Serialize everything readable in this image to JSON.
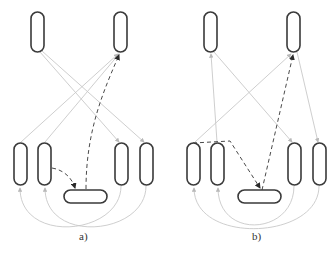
{
  "figure": {
    "panels": [
      {
        "id": "a",
        "caption": "a)",
        "nodes": {
          "top": [
            "top-left",
            "top-right"
          ],
          "bottom": [
            "bottom-1",
            "bottom-2",
            "bottom-3",
            "bottom-4"
          ],
          "center": "center-horizontal"
        },
        "edges_solid": [
          {
            "from": "bottom-1",
            "to": "top-right"
          },
          {
            "from": "bottom-2",
            "to": "top-right"
          },
          {
            "from": "top-left",
            "to": "bottom-3"
          },
          {
            "from": "top-left",
            "to": "bottom-4"
          },
          {
            "from": "bottom-3",
            "to": "bottom-1",
            "shape": "arc"
          },
          {
            "from": "bottom-4",
            "to": "bottom-2",
            "shape": "arc"
          }
        ],
        "edges_dashed": [
          {
            "from": "bottom-2",
            "to": "center-horizontal"
          },
          {
            "from": "center-horizontal",
            "to": "top-right"
          }
        ]
      },
      {
        "id": "b",
        "caption": "b)",
        "nodes": {
          "top": [
            "top-left",
            "top-right"
          ],
          "bottom": [
            "bottom-1",
            "bottom-2",
            "bottom-3",
            "bottom-4"
          ],
          "center": "center-horizontal"
        },
        "edges_solid": [
          {
            "from": "bottom-1",
            "to": "top-right"
          },
          {
            "from": "bottom-2",
            "to": "top-left"
          },
          {
            "from": "top-left",
            "to": "bottom-3"
          },
          {
            "from": "top-right",
            "to": "bottom-4"
          },
          {
            "from": "bottom-4",
            "to": "bottom-1",
            "shape": "arc"
          },
          {
            "from": "bottom-3",
            "to": "bottom-2",
            "shape": "arc"
          }
        ],
        "edges_dashed": [
          {
            "from": "bottom-1",
            "to": "center-horizontal",
            "via": "horizontal-then-diagonal"
          },
          {
            "from": "center-horizontal",
            "to": "top-right"
          }
        ]
      }
    ],
    "colors": {
      "node_stroke": "#3a3a3a",
      "solid_edge": "#c8c8c8",
      "dashed_edge": "#4a4a4a",
      "background": "#ffffff"
    }
  }
}
